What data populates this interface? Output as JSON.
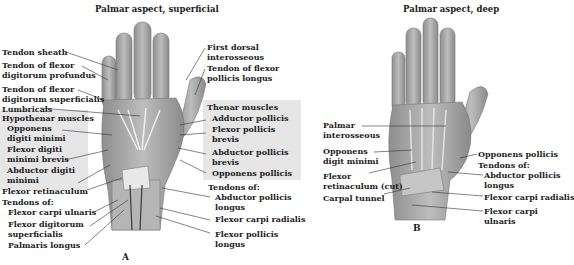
{
  "panel_a": {
    "title": "Palmar aspect, superficial",
    "letter": "A",
    "left_labels": [
      {
        "text": "Tendon sheath"
      },
      {
        "text": "Tendon of flexor"
      },
      {
        "text": "digitorum profundus"
      },
      {
        "text": "Tendon of flexor"
      },
      {
        "text": "digitorum superficialis"
      },
      {
        "text": "Lumbricals"
      },
      {
        "text": "Hypothenar muscles"
      },
      {
        "text": "Opponens"
      },
      {
        "text": "digiti minimi"
      },
      {
        "text": "Flexor digiti"
      },
      {
        "text": "minimi brevis"
      },
      {
        "text": "Abductor digiti"
      },
      {
        "text": "minimi"
      },
      {
        "text": "Flexor retinaculum"
      },
      {
        "text": "Tendons of:"
      },
      {
        "text": "Flexor carpi ulnaris"
      },
      {
        "text": "Flexor digitorum"
      },
      {
        "text": "superficialis"
      },
      {
        "text": "Palmaris longus"
      }
    ],
    "right_labels": [
      {
        "text": "First dorsal"
      },
      {
        "text": "interosseous"
      },
      {
        "text": "Tendon of flexor"
      },
      {
        "text": "pollicis longus"
      },
      {
        "text": "Thenar muscles"
      },
      {
        "text": "Adductor pollicis"
      },
      {
        "text": "Flexor pollicis"
      },
      {
        "text": "brevis"
      },
      {
        "text": "Abductor pollicis"
      },
      {
        "text": "brevis"
      },
      {
        "text": "Opponens pollicis"
      },
      {
        "text": "Tendons of:"
      },
      {
        "text": "Abductor pollicis"
      },
      {
        "text": "longus"
      },
      {
        "text": "Flexor carpi radialis"
      },
      {
        "text": "Flexor pollicis"
      },
      {
        "text": "longus"
      }
    ]
  },
  "panel_b": {
    "title": "Palmar aspect, deep",
    "letter": "B",
    "left_labels": [
      {
        "text": "Palmar"
      },
      {
        "text": "interosseous"
      },
      {
        "text": "Opponens"
      },
      {
        "text": "digit minimi"
      },
      {
        "text": "Flexor"
      },
      {
        "text": "retinaculum (cut)"
      },
      {
        "text": "Carpal tunnel"
      }
    ],
    "right_labels": [
      {
        "text": "Opponens pollicis"
      },
      {
        "text": "Tendons of:"
      },
      {
        "text": "Abductor pollicis"
      },
      {
        "text": "longus"
      },
      {
        "text": "Flexor carpi radialis"
      },
      {
        "text": "Flexor carpi"
      },
      {
        "text": "ulnaris"
      }
    ]
  },
  "colors": {
    "shade_box": "#e6e6e6",
    "hand_fill": "#a9a9a9",
    "hand_light": "#d4d4d4",
    "leader_line": "#333333"
  }
}
